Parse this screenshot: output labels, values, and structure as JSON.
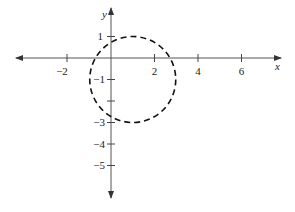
{
  "diagram": {
    "type": "coordinate-plane",
    "x_axis": {
      "label": "x",
      "ticks": [
        -2,
        2,
        4,
        6
      ],
      "tick_labels": [
        "−2",
        "2",
        "4",
        "6"
      ]
    },
    "y_axis": {
      "label": "y",
      "ticks": [
        1,
        -1,
        -3,
        -4,
        -5
      ],
      "tick_labels": [
        "1",
        "−1",
        "−3",
        "−4",
        "−5"
      ],
      "unlabeled_ticks": [
        -2
      ]
    },
    "curve": {
      "shape": "circle",
      "style": "dashed",
      "center": [
        1,
        -1
      ],
      "radius": 2,
      "color": "#111111"
    },
    "axis_color": "#444444"
  }
}
